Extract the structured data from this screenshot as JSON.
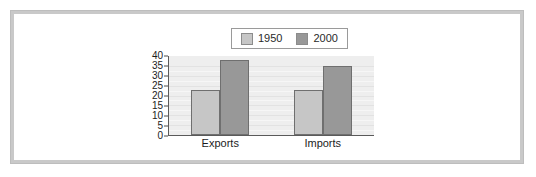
{
  "chart_data": {
    "type": "bar",
    "title": "",
    "subtitle": "",
    "xlabel": "",
    "ylabel": "",
    "categories": [
      "Exports",
      "Imports"
    ],
    "series": [
      {
        "name": "1950",
        "values": [
          23,
          23
        ],
        "color": "#c6c6c6"
      },
      {
        "name": "2000",
        "values": [
          38,
          35
        ],
        "color": "#989898"
      }
    ],
    "ylim": [
      0,
      40
    ],
    "yticks": [
      0,
      5,
      10,
      15,
      20,
      25,
      30,
      35,
      40
    ],
    "ytick_labels": [
      "0",
      "5",
      "10",
      "15",
      "20",
      "25",
      "30",
      "35",
      "40"
    ],
    "grid": true,
    "grid_axis": "y",
    "legend": {
      "position": "top-center",
      "entries": [
        {
          "label": "1950",
          "swatch_color": "#c6c6c6"
        },
        {
          "label": "2000",
          "swatch_color": "#989898"
        }
      ]
    },
    "plot_background": "#eeeeee",
    "frame_border_color": "#c9c9c9"
  }
}
